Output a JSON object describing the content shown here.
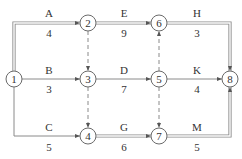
{
  "diagram": {
    "type": "activity-on-arrow network (double-line = critical path)",
    "nodes": [
      {
        "id": "1",
        "label": "1",
        "x": 14,
        "y": 79
      },
      {
        "id": "2",
        "label": "2",
        "x": 88,
        "y": 23
      },
      {
        "id": "3",
        "label": "3",
        "x": 88,
        "y": 79
      },
      {
        "id": "4",
        "label": "4",
        "x": 88,
        "y": 136
      },
      {
        "id": "5",
        "label": "5",
        "x": 159,
        "y": 79
      },
      {
        "id": "6",
        "label": "6",
        "x": 159,
        "y": 23
      },
      {
        "id": "7",
        "label": "7",
        "x": 159,
        "y": 136
      },
      {
        "id": "8",
        "label": "8",
        "x": 230,
        "y": 79
      }
    ],
    "activities": [
      {
        "name": "A",
        "from": "1",
        "to": "2",
        "duration": "4",
        "critical": true
      },
      {
        "name": "B",
        "from": "1",
        "to": "3",
        "duration": "3",
        "critical": false
      },
      {
        "name": "C",
        "from": "1",
        "to": "4",
        "duration": "5",
        "critical": false
      },
      {
        "name": "E",
        "from": "2",
        "to": "6",
        "duration": "9",
        "critical": true
      },
      {
        "name": "D",
        "from": "3",
        "to": "5",
        "duration": "7",
        "critical": false
      },
      {
        "name": "G",
        "from": "4",
        "to": "7",
        "duration": "6",
        "critical": true
      },
      {
        "name": "H",
        "from": "6",
        "to": "8",
        "duration": "3",
        "critical": true
      },
      {
        "name": "K",
        "from": "5",
        "to": "8",
        "duration": "4",
        "critical": false
      },
      {
        "name": "M",
        "from": "7",
        "to": "8",
        "duration": "5",
        "critical": true
      }
    ],
    "dummies": [
      {
        "from": "2",
        "to": "3"
      },
      {
        "from": "3",
        "to": "4"
      },
      {
        "from": "5",
        "to": "6"
      },
      {
        "from": "5",
        "to": "7"
      }
    ],
    "colors": {
      "line": "#8a8a8a",
      "text": "#333333",
      "background": "#ffffff"
    }
  }
}
